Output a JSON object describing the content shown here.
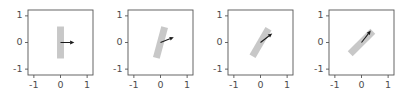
{
  "figure": {
    "width": 404,
    "height": 109,
    "background": "#ffffff",
    "panel_count": 4
  },
  "style": {
    "bar_color": "#c8c8c8",
    "arrow_color": "#1a1a1a",
    "frame_color": "#555555",
    "tick_label_color": "#4d4d4d"
  },
  "chart_data": {
    "type": "scatter",
    "title": "",
    "xlabel": "",
    "ylabel": "",
    "xlim": [
      -1.22,
      1.22
    ],
    "ylim": [
      -1.22,
      1.22
    ],
    "grid": false,
    "legend": null,
    "shared_xticks": [
      "-1",
      "0",
      "1"
    ],
    "shared_yticks": [
      "1",
      "0",
      "-1"
    ],
    "shared_xtick_values": [
      -1,
      0,
      1
    ],
    "shared_ytick_values": [
      1,
      0,
      -1
    ],
    "panels": [
      {
        "index": 0,
        "xticks": [
          "-1",
          "0",
          "1"
        ],
        "yticks": [
          "1",
          "0",
          "-1"
        ],
        "bar": {
          "center": [
            0,
            0
          ],
          "length": 1.2,
          "width": 0.26,
          "angle_from_vertical_deg": 0,
          "color": "#c8c8c8"
        },
        "arrow": {
          "origin": [
            0,
            0
          ],
          "tip": [
            0.52,
            0.0
          ],
          "angle_deg": 0,
          "length": 0.52,
          "color": "#1a1a1a"
        }
      },
      {
        "index": 1,
        "xticks": [
          "-1",
          "0",
          "1"
        ],
        "yticks": [
          "1",
          "0",
          "-1"
        ],
        "bar": {
          "center": [
            0,
            0
          ],
          "length": 1.2,
          "width": 0.26,
          "angle_from_vertical_deg": 15,
          "color": "#c8c8c8"
        },
        "arrow": {
          "origin": [
            0,
            0
          ],
          "tip": [
            0.5,
            0.2
          ],
          "angle_deg": 22,
          "length": 0.54,
          "color": "#1a1a1a"
        }
      },
      {
        "index": 2,
        "xticks": [
          "-1",
          "0",
          "1"
        ],
        "yticks": [
          "1",
          "0",
          "-1"
        ],
        "bar": {
          "center": [
            0,
            0
          ],
          "length": 1.2,
          "width": 0.26,
          "angle_from_vertical_deg": 30,
          "color": "#c8c8c8"
        },
        "arrow": {
          "origin": [
            0,
            0
          ],
          "tip": [
            0.44,
            0.34
          ],
          "angle_deg": 38,
          "length": 0.56,
          "color": "#1a1a1a"
        }
      },
      {
        "index": 3,
        "xticks": [
          "-1",
          "0",
          "1"
        ],
        "yticks": [
          "1",
          "0",
          "-1"
        ],
        "bar": {
          "center": [
            0,
            0
          ],
          "length": 1.2,
          "width": 0.26,
          "angle_from_vertical_deg": 45,
          "color": "#c8c8c8"
        },
        "arrow": {
          "origin": [
            0,
            0
          ],
          "tip": [
            0.35,
            0.45
          ],
          "angle_deg": 52,
          "length": 0.57,
          "color": "#1a1a1a"
        }
      }
    ]
  }
}
